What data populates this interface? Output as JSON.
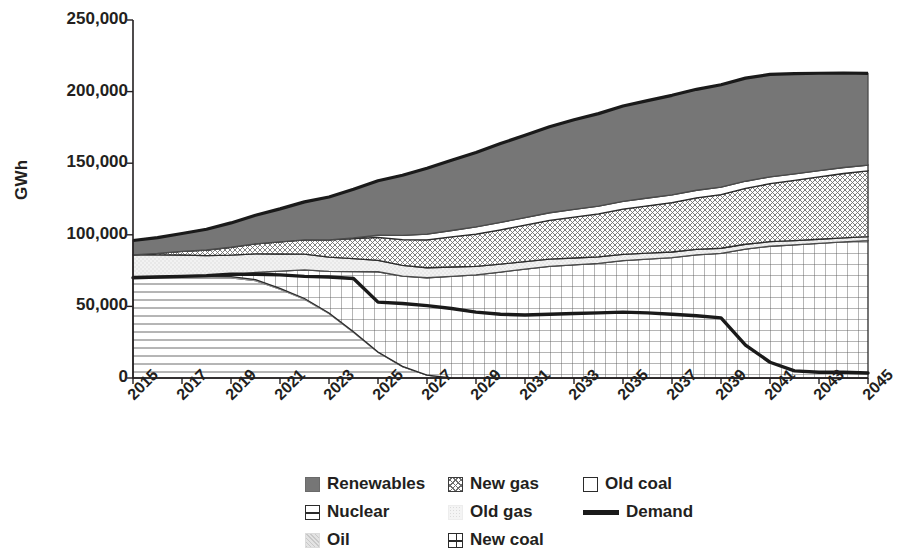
{
  "chart_data": {
    "type": "area",
    "title": "",
    "subtitle": "",
    "xlabel": "",
    "ylabel": "GWh",
    "stacked": true,
    "grid": false,
    "legend_position": "bottom",
    "xlim": [
      2015,
      2045
    ],
    "ylim": [
      0,
      250000
    ],
    "yticks": [
      0,
      50000,
      100000,
      150000,
      200000,
      250000
    ],
    "ytick_labels": [
      "0",
      "50,000",
      "100,000",
      "150,000",
      "200,000",
      "250,000"
    ],
    "x": [
      2015,
      2016,
      2017,
      2018,
      2019,
      2020,
      2021,
      2022,
      2023,
      2024,
      2025,
      2026,
      2027,
      2028,
      2029,
      2030,
      2031,
      2032,
      2033,
      2034,
      2035,
      2036,
      2037,
      2038,
      2039,
      2040,
      2041,
      2042,
      2043,
      2044,
      2045
    ],
    "xtick_labels": [
      "2015",
      "2017",
      "2019",
      "2021",
      "2023",
      "2025",
      "2027",
      "2029",
      "2031",
      "2033",
      "2035",
      "2037",
      "2039",
      "2041",
      "2043",
      "2045"
    ],
    "series": [
      {
        "name": "Nuclear",
        "pattern": "horizontal-lines",
        "values": [
          70000,
          70000,
          70000,
          70000,
          70000,
          68000,
          62000,
          55000,
          45000,
          32000,
          18000,
          8000,
          2000,
          0,
          0,
          0,
          0,
          0,
          0,
          0,
          0,
          0,
          0,
          0,
          0,
          0,
          0,
          0,
          0,
          0,
          0
        ]
      },
      {
        "name": "Oil",
        "pattern": "speckle",
        "values": [
          1000,
          1000,
          900,
          900,
          800,
          700,
          600,
          500,
          400,
          300,
          200,
          100,
          0,
          0,
          0,
          0,
          0,
          0,
          0,
          0,
          0,
          0,
          0,
          0,
          0,
          0,
          0,
          0,
          0,
          0,
          0
        ]
      },
      {
        "name": "New coal",
        "pattern": "grid",
        "values": [
          0,
          0,
          0,
          0,
          1000,
          5000,
          12000,
          20000,
          29000,
          42000,
          56000,
          63000,
          68000,
          71000,
          72000,
          74000,
          76000,
          78000,
          79000,
          80000,
          82000,
          83000,
          84000,
          86000,
          87000,
          90000,
          92000,
          93000,
          94000,
          95000,
          96000
        ]
      },
      {
        "name": "Old gas",
        "pattern": "light-dots",
        "values": [
          15000,
          15000,
          15000,
          14500,
          14000,
          13000,
          12000,
          11000,
          10000,
          9000,
          8000,
          7500,
          7000,
          6500,
          6000,
          5500,
          5200,
          5000,
          4800,
          4600,
          4400,
          4200,
          4000,
          3800,
          3600,
          3400,
          3200,
          3000,
          2900,
          2800,
          2700
        ]
      },
      {
        "name": "New gas",
        "pattern": "crosshatch",
        "values": [
          0,
          1000,
          2500,
          4000,
          5500,
          7000,
          8500,
          10000,
          12000,
          14000,
          16000,
          18000,
          19500,
          21000,
          22500,
          24000,
          25500,
          27000,
          28500,
          30000,
          31500,
          33000,
          34500,
          36000,
          37500,
          39000,
          40500,
          42000,
          43500,
          45000,
          46000
        ]
      },
      {
        "name": "Old coal",
        "pattern": "white",
        "values": [
          0,
          0,
          0,
          0,
          0,
          0,
          0,
          0,
          0,
          500,
          1500,
          3000,
          4000,
          4500,
          5000,
          5200,
          5300,
          5400,
          5500,
          5500,
          5500,
          5500,
          5400,
          5300,
          5200,
          5000,
          4800,
          4600,
          4400,
          4200,
          4000
        ]
      },
      {
        "name": "Renewables",
        "pattern": "solid-gray",
        "values": [
          10000,
          11000,
          12500,
          14500,
          17000,
          20000,
          23000,
          26500,
          30000,
          34000,
          38000,
          42000,
          46000,
          49000,
          52000,
          55000,
          57500,
          60000,
          62500,
          64500,
          66500,
          68000,
          69500,
          70500,
          71500,
          72000,
          71500,
          70000,
          68000,
          66000,
          64000
        ]
      }
    ],
    "total": [
      96000,
      98000,
      100900,
      103900,
      108300,
      113700,
      118100,
      123000,
      126400,
      131800,
      137700,
      141600,
      146500,
      152000,
      157500,
      163700,
      169500,
      175400,
      180300,
      184600,
      189900,
      193700,
      197400,
      201600,
      204800,
      209400,
      212000,
      212600,
      212800,
      213000,
      212700
    ],
    "demand": {
      "name": "Demand",
      "type": "line",
      "color": "#1a1a1a",
      "values": [
        70000,
        70500,
        71000,
        71500,
        72500,
        72500,
        72000,
        71000,
        70500,
        69500,
        53000,
        52000,
        50500,
        48500,
        46000,
        44500,
        44000,
        44500,
        45000,
        45500,
        46000,
        45500,
        44500,
        43500,
        42000,
        23000,
        11000,
        5000,
        4000,
        4000,
        3500
      ]
    }
  },
  "axis": {
    "y_label": "GWh"
  },
  "legend": {
    "rows": [
      [
        {
          "label": "Renewables",
          "swatch": "renewables-swatch"
        },
        {
          "label": "New gas",
          "swatch": "new-gas-swatch"
        },
        {
          "label": "Old coal",
          "swatch": "old-coal-swatch"
        }
      ],
      [
        {
          "label": "Nuclear",
          "swatch": "nuclear-swatch"
        },
        {
          "label": "Old gas",
          "swatch": "old-gas-swatch"
        },
        {
          "label": "Demand",
          "swatch": "demand-line-swatch"
        }
      ],
      [
        {
          "label": "Oil",
          "swatch": "oil-swatch"
        },
        {
          "label": "New coal",
          "swatch": "new-coal-swatch"
        }
      ]
    ]
  },
  "colors": {
    "renewables": "#767676",
    "axis": "#231f20",
    "demand": "#1a1a1a",
    "background": "#ffffff"
  }
}
